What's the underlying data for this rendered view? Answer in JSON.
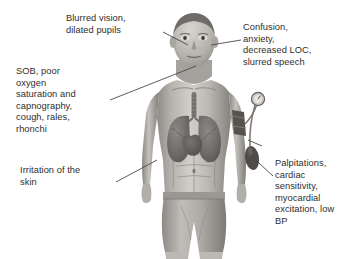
{
  "illustration": {
    "subject": "male-human-figure-anterior-view",
    "description": "Grayscale anatomical illustration of a standing male figure shown from the front, cropped at mid-thigh, with lungs, trachea and heart visible through the chest and a blood-pressure cuff on the left upper arm.",
    "background_color": "#ffffff",
    "line_color": "#4a4a4a",
    "text_color": "#2e2e2e",
    "skin_tone": "#b9b6b2",
    "organ_tone": "#6f6c69"
  },
  "labels": {
    "vision": {
      "text": "Blurred vision,\ndilated pupils",
      "target": "eyes"
    },
    "respiratory": {
      "text": "SOB, poor\noxygen\nsaturation and\ncapnography,\ncough, rales,\nrhonchi",
      "target": "lungs"
    },
    "neuro": {
      "text": "Confusion,\nanxiety,\ndecreased LOC,\nslurred speech",
      "target": "head"
    },
    "skin": {
      "text": "Irritation of the\nskin",
      "target": "forearm"
    },
    "cardiac": {
      "text": "Palpitations,\ncardiac\nsensitivity,\nmyocardial\nexcitation, low\nBP",
      "target": "blood-pressure-cuff"
    }
  },
  "anatomy": {
    "lungs_label": "lungs",
    "trachea_label": "trachea",
    "heart_label": "heart",
    "cuff_label": "blood-pressure-cuff",
    "gauge_label": "pressure-gauge",
    "bulb_label": "inflation-bulb"
  }
}
